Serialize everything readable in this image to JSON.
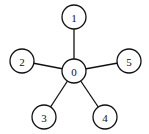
{
  "diagram": {
    "type": "star-graph",
    "center": "0",
    "node_radius": 12,
    "nodes": [
      {
        "id": "0",
        "label": "0",
        "x": 74,
        "y": 71
      },
      {
        "id": "1",
        "label": "1",
        "x": 74,
        "y": 17
      },
      {
        "id": "2",
        "label": "2",
        "x": 22,
        "y": 61
      },
      {
        "id": "3",
        "label": "3",
        "x": 44,
        "y": 117
      },
      {
        "id": "4",
        "label": "4",
        "x": 105,
        "y": 117
      },
      {
        "id": "5",
        "label": "5",
        "x": 129,
        "y": 61
      }
    ],
    "edges": [
      {
        "from": "0",
        "to": "1"
      },
      {
        "from": "0",
        "to": "2"
      },
      {
        "from": "0",
        "to": "3"
      },
      {
        "from": "0",
        "to": "4"
      },
      {
        "from": "0",
        "to": "5"
      }
    ],
    "colors": {
      "stroke": "#111111",
      "fill": "#ffffff",
      "background": "#ffffff"
    }
  }
}
